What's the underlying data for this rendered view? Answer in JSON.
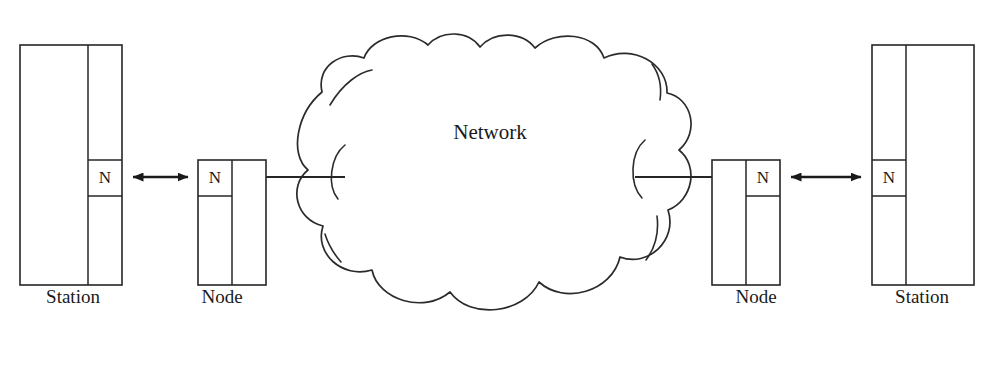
{
  "diagram": {
    "background_color": "#ffffff",
    "stroke_color": "#262626",
    "cloud_label": "Network",
    "nodes": [
      {
        "id": "station-left",
        "caption": "Station",
        "cell_label": "N",
        "caption_x": 73,
        "caption_y": 303
      },
      {
        "id": "node-left",
        "caption": "Node",
        "cell_label": "N",
        "caption_x": 222,
        "caption_y": 303
      },
      {
        "id": "node-right",
        "caption": "Node",
        "cell_label": "N",
        "caption_x": 756,
        "caption_y": 303
      },
      {
        "id": "station-right",
        "caption": "Station",
        "cell_label": "N",
        "caption_x": 922,
        "caption_y": 303
      }
    ],
    "connections": [
      {
        "id": "station-left-to-node-left",
        "type": "double-arrow",
        "from": "station-left",
        "to": "node-left"
      },
      {
        "id": "node-left-to-network",
        "type": "line",
        "from": "node-left",
        "to": "network-cloud"
      },
      {
        "id": "network-to-node-right",
        "type": "line",
        "from": "network-cloud",
        "to": "node-right"
      },
      {
        "id": "node-right-to-station-right",
        "type": "double-arrow",
        "from": "node-right",
        "to": "station-right"
      }
    ]
  }
}
